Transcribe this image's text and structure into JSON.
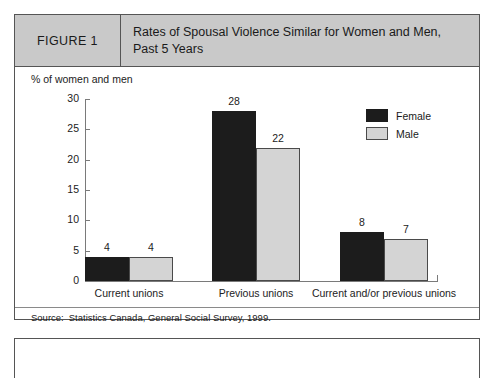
{
  "figure": {
    "number_label": "FIGURE 1",
    "title": "Rates of Spousal Violence Similar for Women and Men, Past 5 Years",
    "source_label": "Source:",
    "source_text": "Statistics Canada, General Social Survey, 1999."
  },
  "chart_data": {
    "type": "bar",
    "title": "Rates of Spousal Violence Similar for Women and Men, Past 5 Years",
    "categories": [
      "Current unions",
      "Previous unions",
      "Current and/or previous unions"
    ],
    "series": [
      {
        "name": "Female",
        "values": [
          4,
          28,
          8
        ],
        "color": "#1c1c1c"
      },
      {
        "name": "Male",
        "values": [
          4,
          22,
          7
        ],
        "color": "#d4d4d4"
      }
    ],
    "xlabel": "",
    "ylabel": "% of women and men",
    "ylim": [
      0,
      30
    ],
    "yticks": [
      0,
      5,
      10,
      15,
      20,
      25,
      30
    ],
    "ytick_labels": [
      "0",
      "5",
      "10",
      "15",
      "20",
      "25",
      "30"
    ],
    "grid": false,
    "legend_position": "top-right",
    "value_labels": [
      "4",
      "4",
      "28",
      "22",
      "8",
      "7"
    ]
  }
}
